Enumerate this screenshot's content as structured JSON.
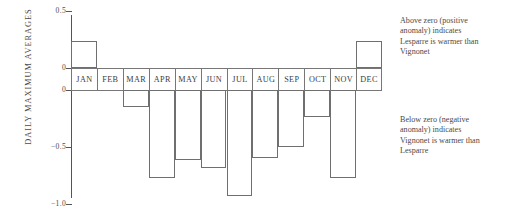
{
  "chart_data": {
    "type": "bar",
    "title": "",
    "subtitle": "",
    "xlabel": "",
    "ylabel": "DAILY MAXIMUM AVERAGES",
    "categories": [
      "JAN",
      "FEB",
      "MAR",
      "APR",
      "MAY",
      "JUN",
      "JUL",
      "AUG",
      "SEP",
      "OCT",
      "NOV",
      "DEC"
    ],
    "values": [
      0.24,
      0.0,
      -0.15,
      -0.77,
      -0.61,
      -0.68,
      -0.93,
      -0.6,
      -0.5,
      -0.24,
      -0.77,
      0.24
    ],
    "series": [
      {
        "name": "Lesparre minus Vignonet anomaly",
        "values": [
          0.24,
          0.0,
          -0.15,
          -0.77,
          -0.61,
          -0.68,
          -0.93,
          -0.6,
          -0.5,
          -0.24,
          -0.77,
          0.24
        ]
      }
    ],
    "ylim": [
      -1.0,
      0.5
    ],
    "ytick_labels": [
      "0.5",
      "0",
      "0",
      "-0.5",
      "-1.0"
    ],
    "ytick_values": [
      0.5,
      0,
      0,
      -0.5,
      -1.0
    ],
    "grid": false,
    "legend_position": "none",
    "annotations": [
      "Above zero (positive anomaly) indicates Lesparre is warmer than Vignonet",
      "Below zero (negative anomaly) indicates Vignonet is warmer than Lesparre"
    ]
  },
  "axis": {
    "y_title": "DAILY MAXIMUM AVERAGES",
    "ticks": [
      {
        "label": "0.5",
        "value": 0.5
      },
      {
        "label": "0",
        "value": 0.0
      },
      {
        "label": "0",
        "value": 0.0
      },
      {
        "label": "-0.5",
        "value": -0.5
      },
      {
        "label": "-1.0",
        "value": -1.0
      }
    ]
  },
  "notes": {
    "above": {
      "line1": "Above zero (positive",
      "line2": "anomaly) indicates",
      "line3": "Lesparre is warmer than",
      "line4": "Vignonet"
    },
    "below": {
      "line1": "Below zero (negative",
      "line2": "anomaly) indicates",
      "line3": "Vignonet is warmer than",
      "line4": "Lesparre"
    }
  },
  "colors": {
    "bar_stroke": "#6f6f6f",
    "axis": "#555555",
    "text": "#4a4a4a",
    "background": "#ffffff"
  }
}
